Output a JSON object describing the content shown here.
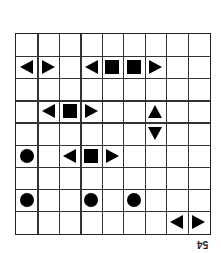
{
  "diagram": {
    "rows": 9,
    "cols": 9,
    "cells": [
      {
        "row": 1,
        "col": 0,
        "shape": "triangle-left"
      },
      {
        "row": 1,
        "col": 1,
        "shape": "triangle-right"
      },
      {
        "row": 1,
        "col": 3,
        "shape": "triangle-left"
      },
      {
        "row": 1,
        "col": 4,
        "shape": "square"
      },
      {
        "row": 1,
        "col": 5,
        "shape": "square"
      },
      {
        "row": 1,
        "col": 6,
        "shape": "triangle-right"
      },
      {
        "row": 3,
        "col": 1,
        "shape": "triangle-left"
      },
      {
        "row": 3,
        "col": 2,
        "shape": "square"
      },
      {
        "row": 3,
        "col": 3,
        "shape": "triangle-right"
      },
      {
        "row": 3,
        "col": 6,
        "shape": "triangle-up"
      },
      {
        "row": 4,
        "col": 6,
        "shape": "triangle-down"
      },
      {
        "row": 5,
        "col": 0,
        "shape": "circle"
      },
      {
        "row": 5,
        "col": 2,
        "shape": "triangle-left"
      },
      {
        "row": 5,
        "col": 3,
        "shape": "square"
      },
      {
        "row": 5,
        "col": 4,
        "shape": "triangle-right"
      },
      {
        "row": 7,
        "col": 0,
        "shape": "circle"
      },
      {
        "row": 7,
        "col": 3,
        "shape": "circle"
      },
      {
        "row": 7,
        "col": 5,
        "shape": "circle"
      },
      {
        "row": 8,
        "col": 7,
        "shape": "triangle-left"
      },
      {
        "row": 8,
        "col": 8,
        "shape": "triangle-right"
      }
    ]
  },
  "page_number": "54"
}
